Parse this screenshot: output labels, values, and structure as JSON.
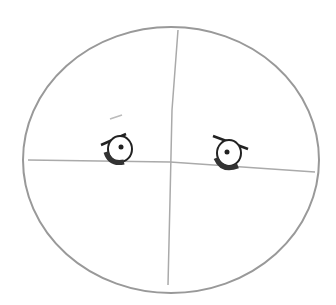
{
  "image": {
    "subject": "pencil sketch of a round face with guide lines and two eyes",
    "stroke_color": "#8a8a8a",
    "ink_color": "#2a2a2a",
    "background": "#ffffff"
  }
}
